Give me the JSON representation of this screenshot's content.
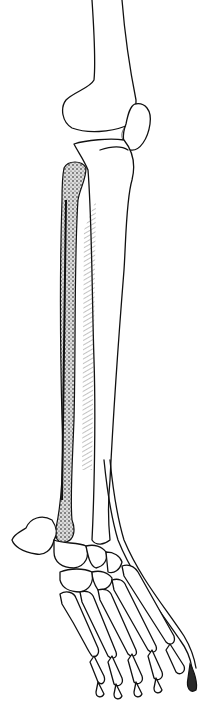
{
  "figure": {
    "type": "anatomical-line-illustration",
    "colors": {
      "background": "#ffffff",
      "ink": "#111111",
      "stipple": "#2a2a2a"
    },
    "parts": [
      {
        "id": "femur",
        "label": ""
      },
      {
        "id": "patella",
        "label": ""
      },
      {
        "id": "tibia",
        "label": ""
      },
      {
        "id": "fibula",
        "label": ""
      },
      {
        "id": "interosseous-membrane",
        "label": ""
      },
      {
        "id": "extensor-tendon",
        "label": ""
      },
      {
        "id": "tarsals",
        "label": ""
      },
      {
        "id": "metatarsals",
        "label": ""
      },
      {
        "id": "phalanges",
        "label": ""
      }
    ]
  }
}
